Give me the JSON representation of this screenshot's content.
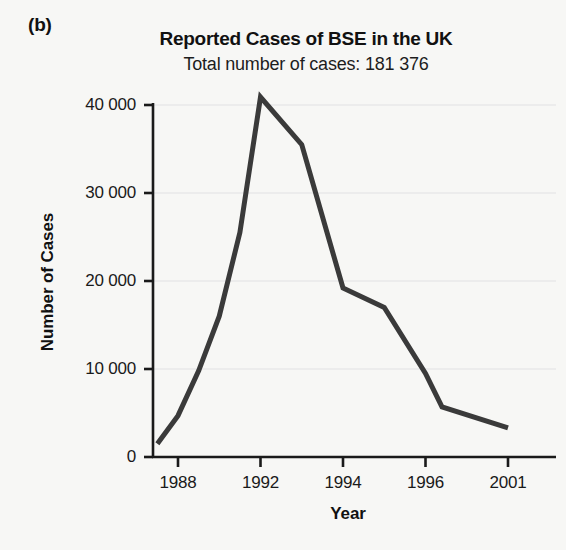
{
  "panel": {
    "label": "(b)"
  },
  "chart_data": {
    "type": "line",
    "title": "Reported Cases of BSE in the UK",
    "subtitle": "Total number of cases: 181 376",
    "xlabel": "Year",
    "ylabel": "Number of Cases",
    "x": [
      1987,
      1988,
      1989,
      1990,
      1991,
      1992,
      1993,
      1994,
      1995,
      1996,
      1997,
      2001
    ],
    "categories": [
      "1987",
      "1988",
      "1989",
      "1990",
      "1991",
      "1992",
      "1993",
      "1994",
      "1995",
      "1996",
      "1997",
      "2001"
    ],
    "values": [
      1500,
      4700,
      9800,
      16000,
      25500,
      40900,
      35500,
      19200,
      17000,
      9500,
      5700,
      3300
    ],
    "series": [
      {
        "name": "Reported BSE cases",
        "color": "#3a3a3a",
        "values": [
          1500,
          4700,
          9800,
          16000,
          25500,
          40900,
          35500,
          19200,
          17000,
          9500,
          5700,
          3300
        ]
      }
    ],
    "ylim": [
      0,
      42000
    ],
    "yticks": [
      0,
      10000,
      20000,
      30000,
      40000
    ],
    "ytick_labels": [
      "0",
      "10 000",
      "20 000",
      "30 000",
      "40 000"
    ],
    "xticks": [
      1988,
      1992,
      1994,
      1996,
      2001
    ],
    "xtick_labels": [
      "1988",
      "1992",
      "1994",
      "1996",
      "2001"
    ],
    "grid": true,
    "grid_axis": "y",
    "legend": false,
    "legend_position": "none",
    "line_color": "#3a3a3a",
    "line_width": 5,
    "background_color": "#f7f7f5",
    "grid_color": "#e8e8e8",
    "axis_color": "#1a1a1a",
    "peak": {
      "label": "1992",
      "value": 40900
    },
    "total_cases": "181 376"
  }
}
